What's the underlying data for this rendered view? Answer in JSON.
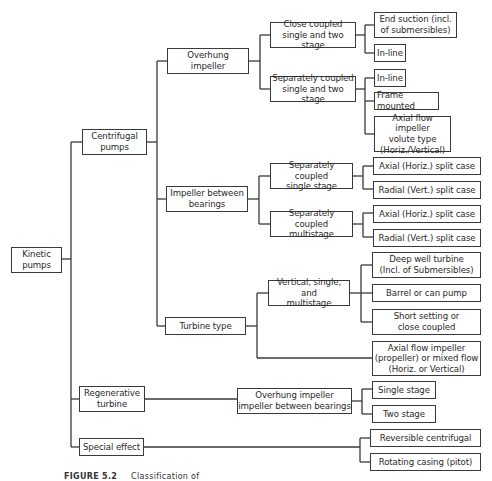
{
  "diagram": {
    "root": {
      "label": "Kinetic\npumps"
    },
    "level1": {
      "centrifugal": "Centrifugal\npumps",
      "regenerative": "Regenerative\nturbine",
      "special": "Special effect"
    },
    "level2": {
      "overhung": "Overhung\nimpeller",
      "between_bearings": "Impeller between\nbearings",
      "turbine_type": "Turbine type",
      "regen_child": "Overhung impeller\nimpeller between bearings"
    },
    "level3": {
      "close_coupled": "Close coupled\nsingle and two stage",
      "sep_coupled_two": "Separately coupled\nsingle and two stage",
      "sep_coupled_single": "Separately coupled\nsingle stage",
      "sep_coupled_multi": "Separately coupled\nmultistage",
      "vertical": "Vertical, single, and\nmultistage"
    },
    "leaves": {
      "end_suction": "End suction (incl.\nof submersibles)",
      "inline_1": "In-line",
      "inline_2": "In-line",
      "frame_mounted": "Frame mounted",
      "axial_volute": "Axial flow impeller\nvolute type\n(Horiz./Vertical)",
      "axial_split_1": "Axial (Horiz.) split case",
      "radial_split_1": "Radial (Vert.) split case",
      "axial_split_2": "Axial (Horiz.) split case",
      "radial_split_2": "Radial (Vert.) split case",
      "deep_well": "Deep well turbine\n(Incl. of Submersibles)",
      "barrel": "Barrel or can pump",
      "short_setting": "Short setting or\nclose coupled",
      "axial_propeller": "Axial flow impeller\n(propeller) or mixed flow\n(Horiz. or Vertical)",
      "single_stage": "Single stage",
      "two_stage": "Two stage",
      "reversible": "Reversible centrifugal",
      "rotating_casing": "Rotating casing (pitot)"
    },
    "caption": {
      "figure": "FIGURE 5.2",
      "text": "Classification of"
    },
    "colors": {
      "line": "#3a3a3a",
      "background": "#ffffff",
      "text": "#2a2a2a"
    }
  }
}
